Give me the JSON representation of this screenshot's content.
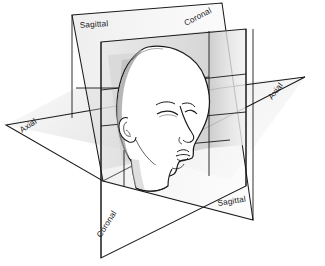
{
  "figure": {
    "background_color": "#ffffff",
    "line_color": "#1a1a1a",
    "plane_fill_light": "#f2f2f2",
    "plane_fill_mid": "#d8d8d8",
    "plane_fill_dark": "#b8b8b8"
  },
  "labels": {
    "sagittal_top": "Sagittal",
    "coronal_top": "Coronal",
    "axial_right": "Axial",
    "axial_left": "Axial",
    "sagittal_bottom": "Sagittal",
    "coronal_bottom": "Coronal"
  },
  "planes": [
    {
      "id": "sagittal",
      "name": "Sagittal",
      "orientation": "vertical-lateral",
      "label_positions": [
        "top-left",
        "bottom-right"
      ]
    },
    {
      "id": "coronal",
      "name": "Coronal",
      "orientation": "vertical-frontal",
      "label_positions": [
        "top-right",
        "bottom-left"
      ]
    },
    {
      "id": "axial",
      "name": "Axial",
      "orientation": "horizontal-transverse",
      "label_positions": [
        "left",
        "right"
      ]
    }
  ]
}
